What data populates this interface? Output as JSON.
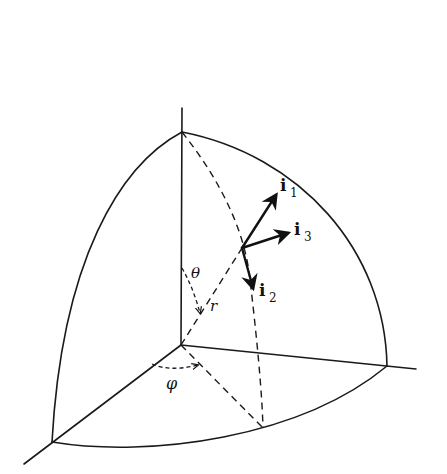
{
  "figure": {
    "background": "#ffffff",
    "stroke_color": "#1a1a1a"
  },
  "labels": {
    "theta": "θ",
    "r": "r",
    "phi": "φ",
    "vectors": [
      {
        "base": "i",
        "sub": "1"
      },
      {
        "base": "i",
        "sub": "3"
      },
      {
        "base": "i",
        "sub": "2"
      }
    ]
  },
  "geometry": {
    "origin": [
      181,
      345
    ],
    "z_axis_top": [
      182,
      108
    ],
    "sphere_top": [
      182,
      132
    ],
    "x_axis_end": [
      24,
      464
    ],
    "sphere_x_point": [
      52,
      442
    ],
    "y_axis_end": [
      416,
      369
    ],
    "sphere_y_point": [
      387,
      366
    ],
    "point_P": [
      242,
      248
    ],
    "meridian_foot": [
      263,
      428
    ],
    "vectors": {
      "i1_tip": [
        276,
        195
      ],
      "i3_tip": [
        288,
        233
      ],
      "i2_tip": [
        253,
        288
      ]
    }
  }
}
